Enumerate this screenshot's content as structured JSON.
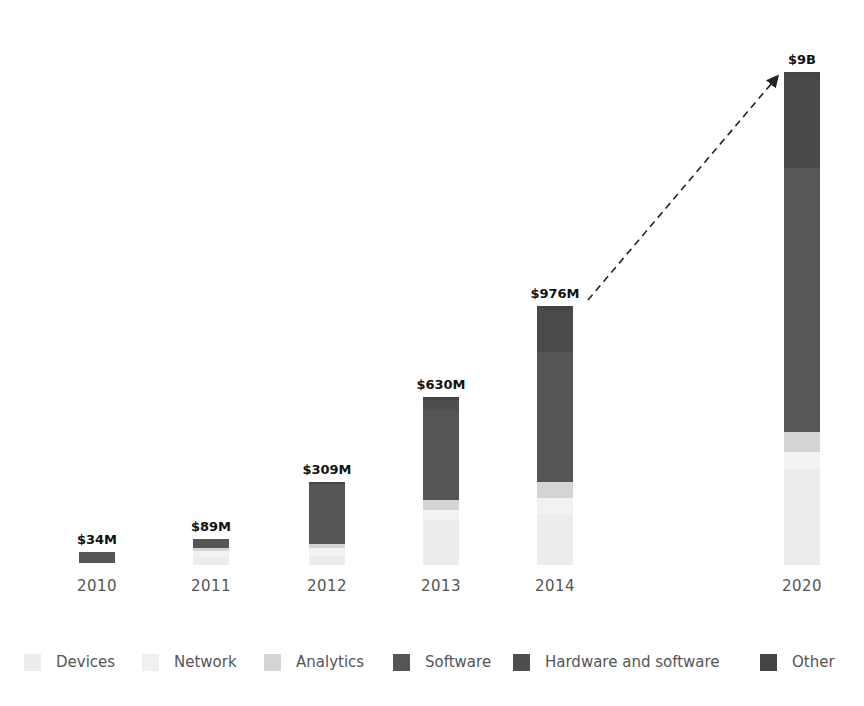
{
  "chart_data": {
    "type": "bar",
    "stacked": true,
    "title": "",
    "xlabel": "",
    "ylabel": "",
    "categories": [
      "2010",
      "2011",
      "2012",
      "2013",
      "2014",
      "2020"
    ],
    "totals_labels": [
      "$34M",
      "$89M",
      "$309M",
      "$630M",
      "$976M",
      "$9B"
    ],
    "totals_musd": [
      34,
      89,
      309,
      630,
      976,
      9000
    ],
    "series": [
      {
        "name": "Devices",
        "color": "#ececec",
        "values": [
          0,
          9,
          25,
          108,
          100,
          1700
        ]
      },
      {
        "name": "Network",
        "color": "#f3f3f3",
        "values": [
          0,
          10,
          10,
          40,
          30,
          300
        ]
      },
      {
        "name": "Analytics",
        "color": "#d4d4d4",
        "values": [
          0,
          10,
          8,
          20,
          30,
          350
        ]
      },
      {
        "name": "Software",
        "color": "#555555",
        "values": [
          34,
          60,
          266,
          440,
          690,
          4900
        ]
      },
      {
        "name": "Hardware and software",
        "color": "#4e4e4e",
        "values": [
          0,
          0,
          0,
          10,
          90,
          1700
        ]
      },
      {
        "name": "Other",
        "color": "#444444",
        "values": [
          0,
          0,
          0,
          12,
          36,
          50
        ]
      }
    ],
    "annotation": {
      "type": "dashed-arrow",
      "from": "2014",
      "to": "2020"
    },
    "grid": false,
    "legend_position": "bottom",
    "axis_break": "x between 2014 and 2020"
  },
  "bars": [
    {
      "year": "2010",
      "label": "$34M",
      "cx": 97,
      "segs": [
        {
          "name": "Software",
          "top": 552,
          "bottom": 563,
          "color": "#555555"
        }
      ]
    },
    {
      "year": "2011",
      "label": "$89M",
      "cx": 211,
      "segs": [
        {
          "name": "Devices",
          "top": 557,
          "bottom": 565,
          "color": "#ececec"
        },
        {
          "name": "Network",
          "top": 551,
          "bottom": 557,
          "color": "#f2f2f2"
        },
        {
          "name": "Analytics",
          "top": 548,
          "bottom": 551,
          "color": "#d4d4d4"
        },
        {
          "name": "Software",
          "top": 539,
          "bottom": 548,
          "color": "#555555"
        }
      ]
    },
    {
      "year": "2012",
      "label": "$309M",
      "cx": 327,
      "segs": [
        {
          "name": "Devices",
          "top": 556,
          "bottom": 565,
          "color": "#ececec"
        },
        {
          "name": "Network",
          "top": 548,
          "bottom": 556,
          "color": "#f2f2f2"
        },
        {
          "name": "Analytics",
          "top": 544,
          "bottom": 548,
          "color": "#d4d4d4"
        },
        {
          "name": "Software",
          "top": 484,
          "bottom": 544,
          "color": "#555555"
        },
        {
          "name": "Other",
          "top": 482,
          "bottom": 484,
          "color": "#444444"
        }
      ]
    },
    {
      "year": "2013",
      "label": "$630M",
      "cx": 441,
      "segs": [
        {
          "name": "Devices",
          "top": 520,
          "bottom": 565,
          "color": "#ececec"
        },
        {
          "name": "Network",
          "top": 510,
          "bottom": 520,
          "color": "#f2f2f2"
        },
        {
          "name": "Analytics",
          "top": 500,
          "bottom": 510,
          "color": "#d4d4d4"
        },
        {
          "name": "Software",
          "top": 410,
          "bottom": 500,
          "color": "#555555"
        },
        {
          "name": "Hardware and software",
          "top": 400,
          "bottom": 410,
          "color": "#4e4e4e"
        },
        {
          "name": "Other",
          "top": 397,
          "bottom": 400,
          "color": "#444444"
        }
      ]
    },
    {
      "year": "2014",
      "label": "$976M",
      "cx": 555,
      "segs": [
        {
          "name": "Devices",
          "top": 514,
          "bottom": 565,
          "color": "#ececec"
        },
        {
          "name": "Network",
          "top": 498,
          "bottom": 514,
          "color": "#f2f2f2"
        },
        {
          "name": "Analytics",
          "top": 482,
          "bottom": 498,
          "color": "#d4d4d4"
        },
        {
          "name": "Software",
          "top": 352,
          "bottom": 482,
          "color": "#555555"
        },
        {
          "name": "Hardware and software",
          "top": 310,
          "bottom": 352,
          "color": "#4a4a4a"
        },
        {
          "name": "Other",
          "top": 306,
          "bottom": 310,
          "color": "#444444"
        }
      ]
    },
    {
      "year": "2020",
      "label": "$9B",
      "cx": 802,
      "segs": [
        {
          "name": "Devices",
          "top": 469,
          "bottom": 565,
          "color": "#ececec"
        },
        {
          "name": "Network",
          "top": 452,
          "bottom": 469,
          "color": "#f3f3f3"
        },
        {
          "name": "Analytics",
          "top": 432,
          "bottom": 452,
          "color": "#d4d4d4"
        },
        {
          "name": "Software",
          "top": 168,
          "bottom": 432,
          "color": "#575757"
        },
        {
          "name": "Hardware and software",
          "top": 74,
          "bottom": 168,
          "color": "#484848"
        },
        {
          "name": "Other",
          "top": 72,
          "bottom": 74,
          "color": "#444444"
        }
      ]
    }
  ],
  "legend": [
    {
      "label": "Devices",
      "color": "#ececec",
      "x": 24
    },
    {
      "label": "Network",
      "color": "#f0f0f0",
      "x": 142
    },
    {
      "label": "Analytics",
      "color": "#d4d4d4",
      "x": 264
    },
    {
      "label": "Software",
      "color": "#555555",
      "x": 393
    },
    {
      "label": "Hardware and software",
      "color": "#4e4e4e",
      "x": 513
    },
    {
      "label": "Other",
      "color": "#444444",
      "x": 760
    }
  ]
}
